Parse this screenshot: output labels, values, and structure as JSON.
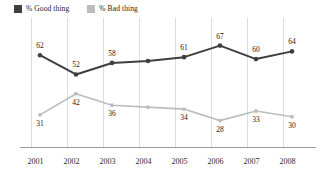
{
  "chart_data": {
    "type": "line",
    "title": "",
    "subtitle": "",
    "xlabel": "",
    "ylabel": "",
    "grid": "vertical",
    "legend_position": "top-left",
    "ylim": [
      0,
      100
    ],
    "categories": [
      "2001",
      "2002",
      "2003",
      "2004",
      "2005",
      "2006",
      "2007",
      "2008"
    ],
    "series": [
      {
        "name": "% Good thing",
        "color": "#3f3f3f",
        "values": [
          62,
          52,
          58,
          59,
          61,
          67,
          60,
          64
        ],
        "labels": [
          "62",
          "52",
          "58",
          "",
          "61",
          "67",
          "60",
          "64"
        ]
      },
      {
        "name": "% Bad thing",
        "color": "#bdbdbd",
        "values": [
          31,
          42,
          36,
          35,
          34,
          28,
          33,
          30
        ],
        "labels": [
          "31",
          "42",
          "36",
          "",
          "34",
          "28",
          "33",
          "30"
        ]
      }
    ]
  },
  "legend": {
    "entries": [
      {
        "label": "% Good thing",
        "color": "#3f3f3f"
      },
      {
        "label": "% Bad thing",
        "color": "#bdbdbd"
      }
    ]
  },
  "axis": {
    "ticks": [
      "2001",
      "2002",
      "2003",
      "2004",
      "2005",
      "2006",
      "2007",
      "2008"
    ],
    "baseline_color": "#9a9a9a",
    "gridline_color": "#dedede"
  }
}
